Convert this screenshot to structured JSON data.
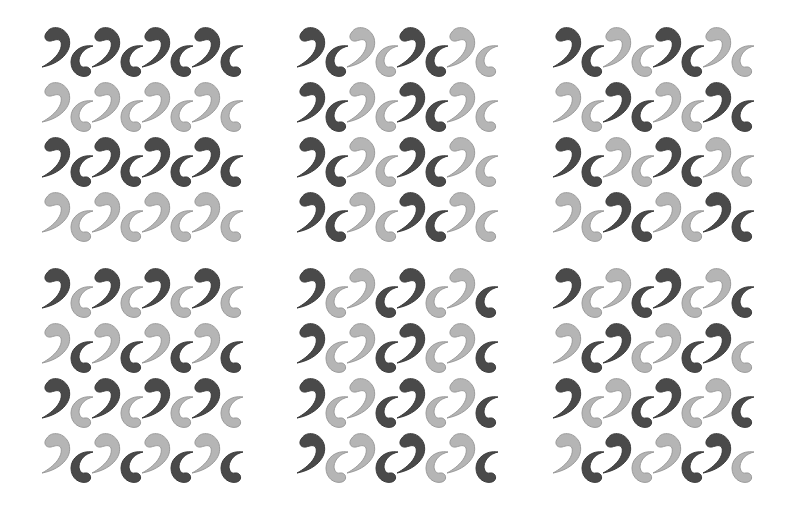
{
  "figure": {
    "colors": {
      "dark": "#4a4a4a",
      "dark_stroke": "#3a3a3a",
      "light": "#b5b5b5",
      "light_stroke": "#9a9a9a",
      "background": "#ffffff"
    },
    "unit_pitch": {
      "x": 50,
      "y": 55
    },
    "panels": [
      {
        "id": "panel-1",
        "x": 36,
        "y": 21,
        "rows": [
          [
            "DD",
            "DD",
            "DD",
            "DD"
          ],
          [
            "LL",
            "LL",
            "LL",
            "LL"
          ],
          [
            "DD",
            "DD",
            "DD",
            "DD"
          ],
          [
            "LL",
            "LL",
            "LL",
            "LL"
          ]
        ]
      },
      {
        "id": "panel-2",
        "x": 291,
        "y": 21,
        "rows": [
          [
            "DD",
            "LL",
            "DD",
            "LL"
          ],
          [
            "DD",
            "LL",
            "DD",
            "LL"
          ],
          [
            "DD",
            "LL",
            "DD",
            "LL"
          ],
          [
            "DD",
            "LL",
            "DD",
            "LL"
          ]
        ]
      },
      {
        "id": "panel-3",
        "x": 547,
        "y": 21,
        "rows": [
          [
            "DD",
            "LL",
            "DD",
            "LL"
          ],
          [
            "LL",
            "DD",
            "LL",
            "DD"
          ],
          [
            "DD",
            "LL",
            "DD",
            "LL"
          ],
          [
            "LL",
            "DD",
            "LL",
            "DD"
          ]
        ]
      },
      {
        "id": "panel-4",
        "x": 36,
        "y": 262,
        "rows": [
          [
            "DL",
            "DL",
            "DL",
            "DL"
          ],
          [
            "LD",
            "LD",
            "LD",
            "LD"
          ],
          [
            "DL",
            "DL",
            "DL",
            "DL"
          ],
          [
            "LD",
            "LD",
            "LD",
            "LD"
          ]
        ]
      },
      {
        "id": "panel-5",
        "x": 291,
        "y": 262,
        "rows": [
          [
            "DL",
            "LD",
            "DL",
            "LD"
          ],
          [
            "DL",
            "LD",
            "DL",
            "LD"
          ],
          [
            "DL",
            "LD",
            "DL",
            "LD"
          ],
          [
            "DL",
            "LD",
            "DL",
            "LD"
          ]
        ]
      },
      {
        "id": "panel-6",
        "x": 547,
        "y": 262,
        "rows": [
          [
            "DL",
            "LD",
            "DL",
            "LD"
          ],
          [
            "LD",
            "DL",
            "LD",
            "DL"
          ],
          [
            "DL",
            "LD",
            "DL",
            "LD"
          ],
          [
            "LD",
            "DL",
            "LD",
            "DL"
          ]
        ]
      }
    ]
  }
}
